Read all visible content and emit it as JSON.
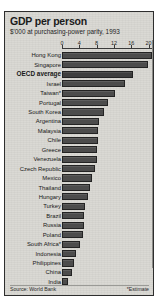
{
  "figure": {
    "title": "GDP per person",
    "subtitle": "$'000 at purchasing-power parity, 1993",
    "source": "Source: World Bank",
    "estimate_note": "*Estimate",
    "colors": {
      "panel_background": "#d9d8d3",
      "bar_fill": "#4c4c4c",
      "bar_stroke": "#232323",
      "text": "#181818",
      "axis": "#3a3a3a"
    }
  },
  "chart_data": {
    "type": "bar",
    "orientation": "horizontal",
    "title": "GDP per person",
    "subtitle": "$'000 at purchasing-power parity, 1993",
    "xlabel": "",
    "ylabel": "",
    "xlim": [
      0,
      20.8
    ],
    "grid": false,
    "legend": null,
    "xticks": [
      0,
      4,
      8,
      12,
      16,
      20
    ],
    "xtick_labels": [
      "0",
      "4",
      "8",
      "12",
      "16",
      "20"
    ],
    "highlight_category": "OECD average",
    "categories": [
      "Hong Kong",
      "Singapore",
      "OECD average",
      "Israel",
      "Taiwan*",
      "Portugal",
      "South Korea",
      "Argentina",
      "Malaysia",
      "Chile",
      "Greece",
      "Venezuela",
      "Czech Republic",
      "Mexico",
      "Thailand",
      "Hungary",
      "Turkey",
      "Brazil",
      "Russia",
      "Poland",
      "South Africa*",
      "Indonesia",
      "Philippines",
      "China",
      "India"
    ],
    "values": [
      20.8,
      19.9,
      16.4,
      14.6,
      12.3,
      10.7,
      9.6,
      8.6,
      8.4,
      8.3,
      8.2,
      8.1,
      7.6,
      7.0,
      6.5,
      6.1,
      5.2,
      5.1,
      5.0,
      4.8,
      4.1,
      3.3,
      2.7,
      2.3,
      1.3
    ]
  }
}
